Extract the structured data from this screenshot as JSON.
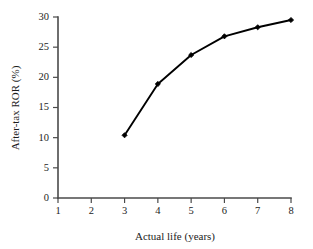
{
  "chart_data": {
    "type": "line",
    "title": "",
    "xlabel": "Actual life (years)",
    "ylabel": "After-tax ROR (%)",
    "x": [
      3,
      4,
      5,
      6,
      7,
      8
    ],
    "values": [
      10.4,
      18.9,
      23.7,
      26.8,
      28.3,
      29.5
    ],
    "series": [
      {
        "name": "After-tax ROR",
        "x": [
          3,
          4,
          5,
          6,
          7,
          8
        ],
        "values": [
          10.4,
          18.9,
          23.7,
          26.8,
          28.3,
          29.5
        ]
      }
    ],
    "xlim": [
      1,
      8
    ],
    "ylim": [
      0,
      30
    ],
    "xticks": [
      1,
      2,
      3,
      4,
      5,
      6,
      7,
      8
    ],
    "xtick_labels": [
      "1",
      "2",
      "3",
      "4",
      "5",
      "6",
      "7",
      "8"
    ],
    "yticks": [
      0,
      5,
      10,
      15,
      20,
      25,
      30
    ],
    "ytick_labels": [
      "0",
      "5",
      "10",
      "15",
      "20",
      "25",
      "30"
    ],
    "grid": false,
    "legend": false,
    "legend_position": "none",
    "marker": "diamond",
    "line_color": "#000000",
    "marker_color": "#000000",
    "axis_color": "#4a4a4a",
    "background_color": "#ffffff"
  }
}
